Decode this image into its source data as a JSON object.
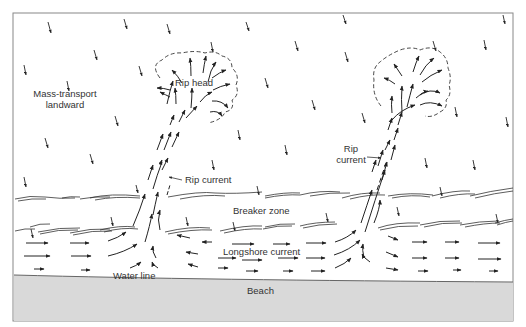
{
  "diagram": {
    "colors": {
      "frame": "#888888",
      "ink": "#222222",
      "beach_fill": "#d9d9d9",
      "beach_edge": "#777777",
      "background": "#ffffff"
    },
    "labels": {
      "mass_transport_line1": "Mass-transport",
      "mass_transport_line2": "landward",
      "rip_head": "Rip head",
      "rip_current_left": "Rip current",
      "rip_current_right_line1": "Rip",
      "rip_current_right_line2": "current",
      "breaker_zone": "Breaker zone",
      "longshore_current": "Longshore current",
      "water_line": "Water line",
      "beach": "Beach"
    },
    "regions": [
      {
        "name": "offshore",
        "description": "Mass-transport landward (small onshore arrows)"
      },
      {
        "name": "rip-head-left",
        "description": "Dashed outline with diverging arrows"
      },
      {
        "name": "rip-head-right",
        "description": "Dashed outline with diverging arrows"
      },
      {
        "name": "breaker-zone",
        "description": "Two bands of wavy breaker lines"
      },
      {
        "name": "surf-zone",
        "description": "Longshore current arrows converging into rip currents"
      },
      {
        "name": "beach",
        "description": "Grey shaded beach"
      }
    ]
  }
}
